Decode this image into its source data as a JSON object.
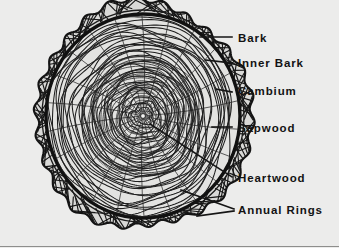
{
  "figure": {
    "background_color": "#ececeb",
    "ink_color": "#141414",
    "width": 339,
    "height": 248
  },
  "labels": [
    {
      "id": "bark",
      "text": "Bark",
      "text_x": 238,
      "text_y": 42,
      "leader": "M200,37 L232,37",
      "anchor_feature": "outer-bark"
    },
    {
      "id": "inner-bark",
      "text": "Inner Bark",
      "text_x": 238,
      "text_y": 67,
      "leader": "M206,60 L232,63",
      "anchor_feature": "inner-bark-layer"
    },
    {
      "id": "cambium",
      "text": "Cambium",
      "text_x": 238,
      "text_y": 95,
      "leader": "M216,89 L232,92",
      "anchor_feature": "cambium-layer"
    },
    {
      "id": "sapwood",
      "text": "Sapwood",
      "text_x": 238,
      "text_y": 132,
      "leader": "M212,127 L232,127",
      "anchor_feature": "sapwood-zone"
    },
    {
      "id": "heartwood",
      "text": "Heartwood",
      "text_x": 238,
      "text_y": 182,
      "leader": "M150,124 L232,177",
      "anchor_feature": "heartwood-core"
    },
    {
      "id": "annual-rings",
      "text": "Annual Rings",
      "text_x": 238,
      "text_y": 214,
      "leader": "M181,190 L234,209 M197,216 L234,211",
      "anchor_feature": "annual-ring-band"
    }
  ],
  "trunk": {
    "center_x": 143,
    "center_y": 116,
    "outer_radius_x": 108,
    "outer_radius_y": 113,
    "bark_thickness": 11,
    "annual_ring_count": 34,
    "ray_count": 22,
    "pith_radius": 2.4,
    "layers": [
      {
        "name": "Bark",
        "order": 1,
        "description": "rough hatched outer scalloped crust"
      },
      {
        "name": "Inner Bark",
        "order": 2,
        "description": "thin band just inside outer bark"
      },
      {
        "name": "Cambium",
        "order": 3,
        "description": "heavy dark growth ring boundary"
      },
      {
        "name": "Sapwood",
        "order": 4,
        "description": "outer lighter wood rings"
      },
      {
        "name": "Heartwood",
        "order": 5,
        "description": "dense dark central wood"
      },
      {
        "name": "Annual Rings",
        "order": 6,
        "description": "concentric yearly growth rings"
      }
    ]
  }
}
